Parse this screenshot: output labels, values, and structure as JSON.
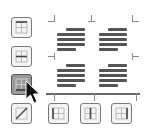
{
  "border_buttons": {
    "left": [
      {
        "name": "top-border",
        "pressed": false
      },
      {
        "name": "inside-horizontal-border",
        "pressed": false
      },
      {
        "name": "bottom-border",
        "pressed": true
      },
      {
        "name": "diagonal-down-border",
        "pressed": false
      }
    ],
    "bottom": [
      {
        "name": "left-border",
        "pressed": false
      },
      {
        "name": "inside-vertical-border",
        "pressed": false
      },
      {
        "name": "right-border",
        "pressed": false
      }
    ]
  },
  "preview": {
    "blocks": 4,
    "lines_per_block": 5,
    "bottom_border_visible": true,
    "line_color": "#555555",
    "border_color": "#7a7a7a"
  },
  "pressed_color": "#9a9a9a"
}
